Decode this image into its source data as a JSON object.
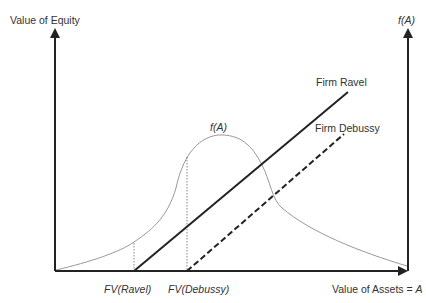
{
  "diagram": {
    "y_axis_left_label": "Value of Equity",
    "y_axis_right_label": "f(A)",
    "x_axis_label": "Value of Assets = A",
    "curve_label": "f(A)",
    "lines": [
      {
        "name": "Firm Ravel",
        "style": "solid"
      },
      {
        "name": "Firm Debussy",
        "style": "dashed"
      }
    ],
    "x_ticks": [
      "FV(Ravel)",
      "FV(Debussy)"
    ]
  },
  "labels": {
    "left_axis": "Value of Equity",
    "right_axis": "f(A)",
    "x_axis_prefix": "Value of Assets = ",
    "x_axis_var": "A",
    "curve": "f(A)",
    "ravel": "Firm Ravel",
    "debussy": "Firm Debussy",
    "fv_ravel_fv": "FV",
    "fv_ravel_name": "Ravel",
    "fv_debussy_fv": "FV",
    "fv_debussy_name": "Debussy",
    "open": "(",
    "close": ")"
  }
}
